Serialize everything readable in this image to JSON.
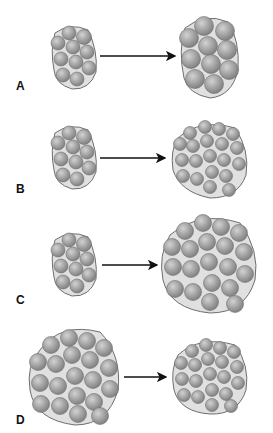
{
  "diagram": {
    "colors": {
      "cell_fill": "#9a9a9a",
      "cell_highlight": "#d0d0d0",
      "cell_edge": "#6e6e6e",
      "matrix_fill": "#dedede",
      "matrix_edge": "#707070",
      "arrow": "#111111",
      "background": "#ffffff"
    },
    "panels": [
      {
        "label": "A",
        "before": "cluster of 11 small cells",
        "after": "cluster of 11 enlarged cells"
      },
      {
        "label": "B",
        "before": "cluster of 11 small cells",
        "after": "cluster of ~22 small cells"
      },
      {
        "label": "C",
        "before": "cluster of 11 small cells",
        "after": "cluster of ~22 enlarged cells"
      },
      {
        "label": "D",
        "before": "cluster of ~22 large cells",
        "after": "cluster of ~22 small cells"
      }
    ]
  }
}
